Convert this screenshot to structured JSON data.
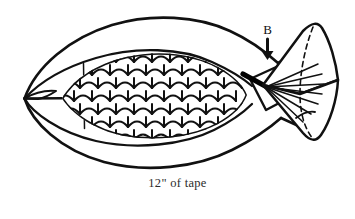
{
  "figure": {
    "name": "fish-with-tape-diagram",
    "caption": "12\" of tape",
    "labels": {
      "tail_point_b": "B"
    },
    "colors": {
      "ink": "#111111",
      "background": "#ffffff",
      "caption_text": "#2b2b2b",
      "tape_band": "#000000"
    },
    "parts": {
      "outer_tape_loop": "outer-tape-loop",
      "body_outline": "fish-body-outline",
      "scales": "fish-scales",
      "head": "fish-head",
      "eye": "fish-eye",
      "gill_line": "gill-line",
      "peduncle_tape": "peduncle-tape-band",
      "tail_fan": "tail-fan",
      "tail_dashed_fold": "tail-dashed-fold",
      "pointer_arrow": "pointer-arrow-b"
    },
    "icons": {
      "arrow": "down-arrow-icon",
      "eye_dot": "eye-dot-icon"
    }
  }
}
